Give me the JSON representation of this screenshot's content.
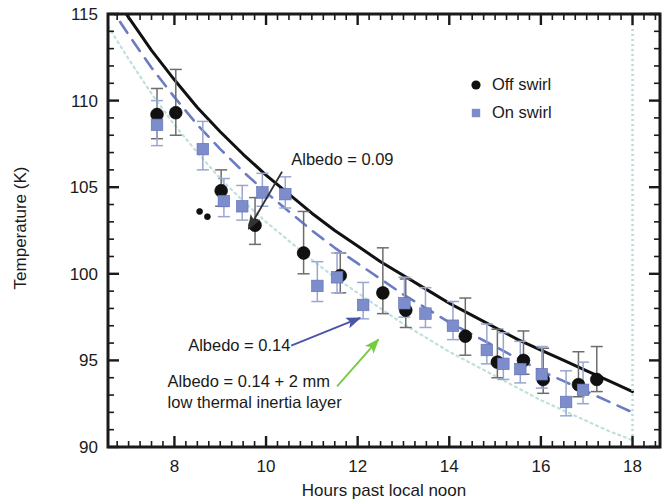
{
  "chart_data": {
    "type": "scatter",
    "title": "",
    "xlabel": "Hours past local noon",
    "ylabel": "Temperature (K)",
    "xlim": [
      6.55,
      18.6
    ],
    "ylim": [
      90,
      115
    ],
    "xticks": [
      8,
      10,
      12,
      14,
      16,
      18
    ],
    "xtick_labels": [
      "8",
      "10",
      "12",
      "14",
      "16",
      "18"
    ],
    "yticks": [
      90,
      95,
      100,
      105,
      110,
      115
    ],
    "ytick_labels": [
      "90",
      "95",
      "100",
      "105",
      "110",
      "115"
    ],
    "x_minor_step": 0.25,
    "y_minor_step": 1,
    "grid": false,
    "legend_position": "upper right",
    "legend": [
      {
        "name": "Off swirl",
        "marker": "circle",
        "color": "#111111"
      },
      {
        "name": "On swirl",
        "marker": "square",
        "color": "#7d8ccb"
      }
    ],
    "series": [
      {
        "name": "Off swirl",
        "marker": "circle",
        "color": "#111111",
        "points": [
          {
            "x": 7.62,
            "y": 109.2,
            "err_lo": 1.4,
            "err_hi": 1.5
          },
          {
            "x": 8.03,
            "y": 109.3,
            "err_lo": 1.3,
            "err_hi": 2.5
          },
          {
            "x": 8.55,
            "y": 103.6,
            "err_lo": 0.0,
            "err_hi": 0.0
          },
          {
            "x": 8.72,
            "y": 103.3,
            "err_lo": 0.0,
            "err_hi": 0.0
          },
          {
            "x": 9.02,
            "y": 104.8,
            "err_lo": 0.9,
            "err_hi": 1.2
          },
          {
            "x": 9.76,
            "y": 102.8,
            "err_lo": 1.1,
            "err_hi": 1.6
          },
          {
            "x": 10.82,
            "y": 101.2,
            "err_lo": 1.2,
            "err_hi": 2.4
          },
          {
            "x": 11.62,
            "y": 99.9,
            "err_lo": 1.0,
            "err_hi": 1.3
          },
          {
            "x": 12.55,
            "y": 98.9,
            "err_lo": 1.2,
            "err_hi": 2.6
          },
          {
            "x": 13.05,
            "y": 97.9,
            "err_lo": 1.0,
            "err_hi": 1.8
          },
          {
            "x": 14.35,
            "y": 96.4,
            "err_lo": 1.1,
            "err_hi": 2.2
          },
          {
            "x": 15.05,
            "y": 94.9,
            "err_lo": 0.9,
            "err_hi": 1.9
          },
          {
            "x": 15.62,
            "y": 95.0,
            "err_lo": 0.8,
            "err_hi": 1.7
          },
          {
            "x": 16.05,
            "y": 93.9,
            "err_lo": 0.8,
            "err_hi": 1.8
          },
          {
            "x": 16.82,
            "y": 93.6,
            "err_lo": 0.7,
            "err_hi": 1.9
          },
          {
            "x": 17.22,
            "y": 93.9,
            "err_lo": 0.7,
            "err_hi": 1.9
          }
        ]
      },
      {
        "name": "On swirl",
        "marker": "square",
        "color": "#7d8ccb",
        "points": [
          {
            "x": 7.62,
            "y": 108.6,
            "err_lo": 1.2,
            "err_hi": 1.4
          },
          {
            "x": 8.62,
            "y": 107.2,
            "err_lo": 1.2,
            "err_hi": 1.6
          },
          {
            "x": 9.08,
            "y": 104.2,
            "err_lo": 0.9,
            "err_hi": 1.3
          },
          {
            "x": 9.48,
            "y": 103.9,
            "err_lo": 0.8,
            "err_hi": 1.2
          },
          {
            "x": 9.92,
            "y": 104.7,
            "err_lo": 0.8,
            "err_hi": 1.1
          },
          {
            "x": 10.42,
            "y": 104.6,
            "err_lo": 0.8,
            "err_hi": 1.0
          },
          {
            "x": 11.12,
            "y": 99.3,
            "err_lo": 0.9,
            "err_hi": 1.4
          },
          {
            "x": 11.55,
            "y": 99.8,
            "err_lo": 0.9,
            "err_hi": 1.4
          },
          {
            "x": 12.12,
            "y": 98.2,
            "err_lo": 0.8,
            "err_hi": 1.3
          },
          {
            "x": 13.02,
            "y": 98.3,
            "err_lo": 0.8,
            "err_hi": 1.5
          },
          {
            "x": 13.48,
            "y": 97.7,
            "err_lo": 0.8,
            "err_hi": 1.5
          },
          {
            "x": 14.08,
            "y": 97.0,
            "err_lo": 0.8,
            "err_hi": 1.4
          },
          {
            "x": 14.82,
            "y": 95.6,
            "err_lo": 0.8,
            "err_hi": 1.5
          },
          {
            "x": 15.18,
            "y": 94.8,
            "err_lo": 0.9,
            "err_hi": 1.8
          },
          {
            "x": 15.55,
            "y": 94.5,
            "err_lo": 0.8,
            "err_hi": 1.6
          },
          {
            "x": 16.02,
            "y": 94.2,
            "err_lo": 0.8,
            "err_hi": 1.6
          },
          {
            "x": 16.55,
            "y": 92.6,
            "err_lo": 0.8,
            "err_hi": 1.8
          },
          {
            "x": 16.92,
            "y": 93.3,
            "err_lo": 0.8,
            "err_hi": 1.6
          }
        ]
      }
    ],
    "model_curves": [
      {
        "name": "Albedo = 0.09",
        "style": "solid",
        "color": "#111111",
        "x": [
          6.55,
          7.0,
          7.5,
          8.0,
          8.5,
          9.0,
          9.5,
          10.0,
          10.5,
          11.0,
          11.5,
          12.0,
          12.5,
          13.0,
          13.5,
          14.0,
          14.5,
          15.0,
          15.5,
          16.0,
          16.5,
          17.0,
          17.5,
          18.0
        ],
        "y": [
          116.6,
          114.8,
          112.9,
          111.2,
          109.6,
          108.2,
          106.9,
          105.7,
          104.6,
          103.5,
          102.5,
          101.6,
          100.7,
          99.9,
          99.1,
          98.3,
          97.6,
          96.9,
          96.2,
          95.6,
          95.0,
          94.4,
          93.8,
          93.2
        ]
      },
      {
        "name": "Albedo = 0.14",
        "style": "dashed",
        "color": "#6b7bc4",
        "x": [
          6.55,
          7.0,
          7.5,
          8.0,
          8.5,
          9.0,
          9.5,
          10.0,
          10.5,
          11.0,
          11.5,
          12.0,
          12.5,
          13.0,
          13.5,
          14.0,
          14.5,
          15.0,
          15.5,
          16.0,
          16.5,
          17.0,
          17.5,
          18.0
        ],
        "y": [
          115.6,
          113.8,
          111.9,
          110.2,
          108.6,
          107.2,
          105.9,
          104.7,
          103.6,
          102.5,
          101.5,
          100.6,
          99.7,
          98.8,
          98.0,
          97.2,
          96.5,
          95.8,
          95.1,
          94.4,
          93.8,
          93.2,
          92.6,
          92.0
        ]
      },
      {
        "name": "Albedo = 0.14 + 2 mm low thermal inertia layer",
        "style": "dotted",
        "color": "#bfe0dc",
        "x": [
          6.55,
          7.0,
          7.5,
          8.0,
          8.5,
          9.0,
          9.5,
          10.0,
          10.5,
          11.0,
          11.5,
          12.0,
          12.5,
          13.0,
          13.5,
          14.0,
          14.5,
          15.0,
          15.5,
          16.0,
          16.5,
          17.0,
          17.5,
          18.0
        ],
        "y": [
          114.3,
          112.4,
          110.4,
          108.6,
          107.0,
          105.5,
          104.2,
          103.0,
          101.9,
          100.8,
          99.8,
          98.9,
          98.0,
          97.1,
          96.3,
          95.5,
          94.8,
          94.1,
          93.4,
          92.7,
          92.1,
          91.5,
          90.9,
          90.4
        ]
      }
    ],
    "terminator_line": {
      "x": 18,
      "style": "dotted",
      "color": "#bcd4dc"
    },
    "annotations": [
      {
        "id": "albedo-009",
        "text": "Albedo = 0.09",
        "text_x": 10.55,
        "text_y": 106.6,
        "arrow_from_x": 10.35,
        "arrow_from_y": 105.9,
        "arrow_to_x": 9.62,
        "arrow_to_y": 102.6,
        "color": "#333333"
      },
      {
        "id": "albedo-014",
        "text": "Albedo = 0.14",
        "text_x": 8.3,
        "text_y": 95.9,
        "arrow_from_x": 10.55,
        "arrow_from_y": 95.85,
        "arrow_to_x": 12.05,
        "arrow_to_y": 97.45,
        "color": "#4b55a8"
      },
      {
        "id": "albedo-014-layer-line1",
        "text": "Albedo = 0.14 + 2 mm",
        "text_x": 7.85,
        "text_y": 93.8,
        "arrow_from_x": 11.55,
        "arrow_from_y": 93.5,
        "arrow_to_x": 12.45,
        "arrow_to_y": 96.2,
        "color": "#7ac943"
      },
      {
        "id": "albedo-014-layer-line2",
        "text": "low thermal inertia layer",
        "text_x": 7.85,
        "text_y": 92.6
      }
    ]
  },
  "figure": {
    "background": "#ffffff",
    "frame_color": "#1a1a1a"
  }
}
